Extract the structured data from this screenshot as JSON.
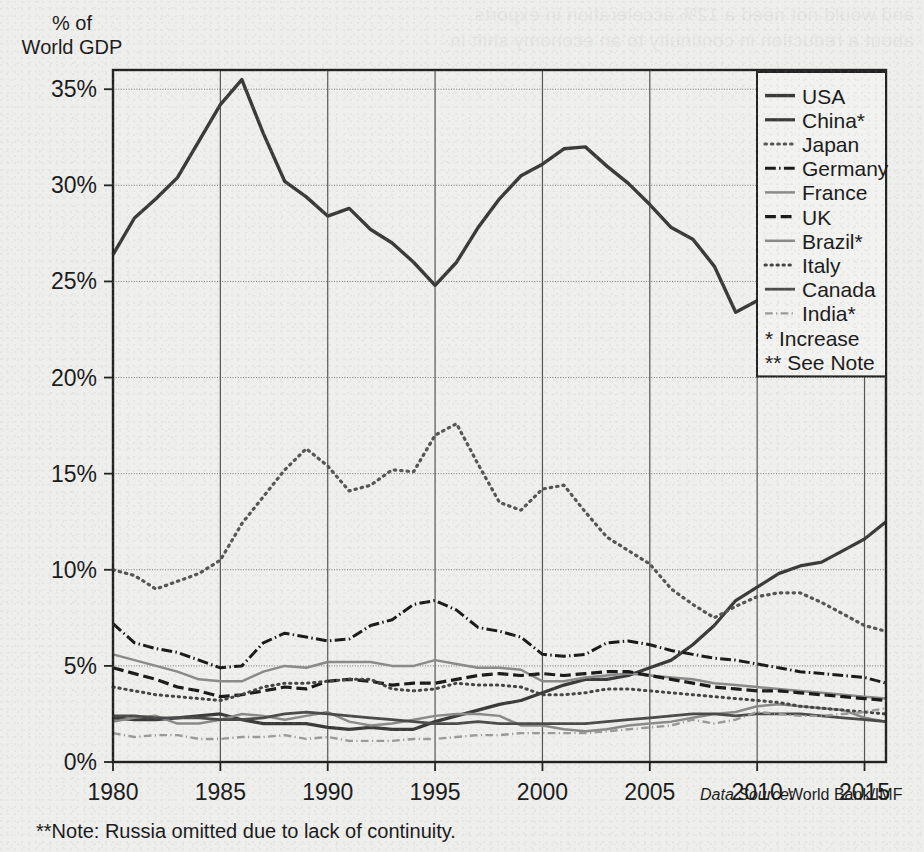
{
  "figure": {
    "y_axis_title_line1": "% of",
    "y_axis_title_line2": "World GDP",
    "note": "**Note: Russia omitted due to lack of continuity.",
    "source_prefix": "Data Source:",
    "source_value": "World Bank/IMF",
    "bleed_line1": "and would not need a 12% acceleration in exports.",
    "bleed_line2": "about a reduction in continuity to an economy shift in"
  },
  "legend": {
    "entries": [
      {
        "label": "USA",
        "style": "solid-thick",
        "color": "#3a3a3a"
      },
      {
        "label": "China*",
        "style": "solid-thick",
        "color": "#3a3a3a"
      },
      {
        "label": "Japan",
        "style": "dotted",
        "color": "#555555"
      },
      {
        "label": "Germany",
        "style": "dash-dot",
        "color": "#1a1a1a"
      },
      {
        "label": "France",
        "style": "solid-thin",
        "color": "#8a8a8a"
      },
      {
        "label": "UK",
        "style": "long-dash",
        "color": "#1a1a1a"
      },
      {
        "label": "Brazil*",
        "style": "solid-thin",
        "color": "#8a8a8a"
      },
      {
        "label": "Italy",
        "style": "dotted",
        "color": "#444444"
      },
      {
        "label": "Canada",
        "style": "solid-thick",
        "color": "#4a4a4a"
      },
      {
        "label": "India*",
        "style": "dash-dot-thin",
        "color": "#9a9a9a"
      }
    ],
    "footnotes": [
      "* Increase",
      "** See Note"
    ]
  },
  "chart_data": {
    "type": "line",
    "title": "",
    "xlabel": "",
    "ylabel": "% of World GDP",
    "xlim": [
      1980,
      2016
    ],
    "ylim": [
      0,
      36
    ],
    "grid": true,
    "legend_position": "top-right",
    "xticks": [
      1980,
      1985,
      1990,
      1995,
      2000,
      2005,
      2010,
      2015
    ],
    "yticks": [
      0,
      5,
      10,
      15,
      20,
      25,
      30,
      35
    ],
    "ytick_labels": [
      "0%",
      "5%",
      "10%",
      "15%",
      "20%",
      "25%",
      "30%",
      "35%"
    ],
    "x": [
      1980,
      1981,
      1982,
      1983,
      1984,
      1985,
      1986,
      1987,
      1988,
      1989,
      1990,
      1991,
      1992,
      1993,
      1994,
      1995,
      1996,
      1997,
      1998,
      1999,
      2000,
      2001,
      2002,
      2003,
      2004,
      2005,
      2006,
      2007,
      2008,
      2009,
      2010,
      2011,
      2012,
      2013,
      2014,
      2015,
      2016
    ],
    "series": [
      {
        "name": "USA",
        "style": "solid-thick",
        "color": "#3a3a3a",
        "width": 3.4,
        "values": [
          26.4,
          28.3,
          29.3,
          30.4,
          32.3,
          34.2,
          35.5,
          32.7,
          30.2,
          29.4,
          28.4,
          28.8,
          27.7,
          27.0,
          26.0,
          24.8,
          26.0,
          27.8,
          29.3,
          30.5,
          31.1,
          31.9,
          32.0,
          31.0,
          30.1,
          29.0,
          27.8,
          27.2,
          25.8,
          23.4,
          24.0,
          22.1,
          21.8,
          21.6,
          21.2,
          20.5,
          20.1
        ]
      },
      {
        "name": "China*",
        "style": "solid-thick",
        "color": "#3a3a3a",
        "width": 3.2,
        "values": [
          2.3,
          2.2,
          2.2,
          2.3,
          2.4,
          2.5,
          2.2,
          2.0,
          2.0,
          2.0,
          1.8,
          1.7,
          1.8,
          1.7,
          1.7,
          2.1,
          2.4,
          2.7,
          3.0,
          3.2,
          3.6,
          4.0,
          4.3,
          4.3,
          4.5,
          4.9,
          5.3,
          6.1,
          7.1,
          8.4,
          9.1,
          9.8,
          10.2,
          10.4,
          11.0,
          11.6,
          12.5
        ]
      },
      {
        "name": "Japan",
        "style": "dotted",
        "color": "#555555",
        "width": 3.2,
        "values": [
          10.0,
          9.7,
          9.0,
          9.4,
          9.8,
          10.5,
          12.4,
          13.8,
          15.2,
          16.3,
          15.4,
          14.1,
          14.4,
          15.2,
          15.1,
          17.0,
          17.6,
          15.5,
          13.5,
          13.1,
          14.2,
          14.4,
          13.0,
          11.7,
          11.0,
          10.3,
          9.0,
          8.2,
          7.5,
          8.1,
          8.6,
          8.8,
          8.8,
          8.3,
          7.7,
          7.1,
          6.8
        ]
      },
      {
        "name": "Germany",
        "style": "dash-dot",
        "color": "#1a1a1a",
        "width": 3.0,
        "values": [
          7.2,
          6.2,
          5.9,
          5.7,
          5.3,
          4.9,
          5.0,
          6.2,
          6.7,
          6.5,
          6.3,
          6.4,
          7.1,
          7.4,
          8.2,
          8.4,
          7.9,
          7.0,
          6.8,
          6.5,
          5.6,
          5.5,
          5.6,
          6.2,
          6.3,
          6.1,
          5.8,
          5.6,
          5.4,
          5.3,
          5.1,
          4.9,
          4.7,
          4.6,
          4.5,
          4.4,
          4.1
        ]
      },
      {
        "name": "France",
        "style": "solid-thin",
        "color": "#8a8a8a",
        "width": 2.5,
        "values": [
          5.6,
          5.3,
          5.0,
          4.7,
          4.3,
          4.2,
          4.2,
          4.7,
          5.0,
          4.9,
          5.2,
          5.2,
          5.2,
          5.0,
          5.0,
          5.3,
          5.1,
          4.9,
          4.9,
          4.8,
          4.2,
          4.2,
          4.4,
          4.5,
          4.6,
          4.5,
          4.4,
          4.3,
          4.1,
          4.0,
          3.9,
          3.8,
          3.7,
          3.6,
          3.5,
          3.4,
          3.3
        ]
      },
      {
        "name": "UK",
        "style": "long-dash",
        "color": "#1a1a1a",
        "width": 3.2,
        "values": [
          4.9,
          4.6,
          4.3,
          3.9,
          3.7,
          3.4,
          3.5,
          3.7,
          3.9,
          3.8,
          4.2,
          4.3,
          4.2,
          4.0,
          4.1,
          4.1,
          4.3,
          4.5,
          4.6,
          4.5,
          4.6,
          4.5,
          4.6,
          4.7,
          4.7,
          4.5,
          4.3,
          4.1,
          3.9,
          3.8,
          3.7,
          3.7,
          3.6,
          3.5,
          3.4,
          3.3,
          3.2
        ]
      },
      {
        "name": "Brazil*",
        "style": "solid-thin",
        "color": "#8a8a8a",
        "width": 2.5,
        "values": [
          2.1,
          2.3,
          2.4,
          2.0,
          2.0,
          2.2,
          2.5,
          2.4,
          2.2,
          2.4,
          2.6,
          2.1,
          1.9,
          2.0,
          2.2,
          2.4,
          2.5,
          2.5,
          2.4,
          1.9,
          1.9,
          1.7,
          1.6,
          1.7,
          1.9,
          2.0,
          2.1,
          2.3,
          2.5,
          2.6,
          2.9,
          3.0,
          2.9,
          2.8,
          2.7,
          2.3,
          2.1
        ]
      },
      {
        "name": "Italy",
        "style": "dotted",
        "color": "#444444",
        "width": 3.0,
        "values": [
          3.9,
          3.7,
          3.5,
          3.4,
          3.3,
          3.2,
          3.5,
          3.9,
          4.1,
          4.1,
          4.2,
          4.3,
          4.3,
          3.8,
          3.7,
          3.8,
          4.1,
          4.0,
          4.0,
          3.9,
          3.5,
          3.5,
          3.6,
          3.8,
          3.8,
          3.7,
          3.6,
          3.5,
          3.4,
          3.3,
          3.2,
          3.1,
          2.9,
          2.8,
          2.7,
          2.6,
          2.5
        ]
      },
      {
        "name": "Canada",
        "style": "solid-thick",
        "color": "#4a4a4a",
        "width": 2.8,
        "values": [
          2.4,
          2.4,
          2.3,
          2.3,
          2.3,
          2.2,
          2.2,
          2.3,
          2.5,
          2.6,
          2.5,
          2.4,
          2.3,
          2.2,
          2.1,
          2.0,
          2.0,
          2.1,
          2.0,
          2.0,
          2.0,
          2.0,
          2.0,
          2.1,
          2.2,
          2.3,
          2.4,
          2.5,
          2.5,
          2.4,
          2.5,
          2.5,
          2.5,
          2.4,
          2.3,
          2.2,
          2.1
        ]
      },
      {
        "name": "India*",
        "style": "dash-dot-thin",
        "color": "#9a9a9a",
        "width": 2.4,
        "values": [
          1.5,
          1.3,
          1.4,
          1.4,
          1.2,
          1.2,
          1.3,
          1.3,
          1.4,
          1.2,
          1.3,
          1.1,
          1.1,
          1.1,
          1.2,
          1.2,
          1.3,
          1.4,
          1.4,
          1.5,
          1.5,
          1.5,
          1.5,
          1.6,
          1.7,
          1.8,
          1.9,
          2.2,
          2.0,
          2.2,
          2.6,
          2.5,
          2.4,
          2.4,
          2.5,
          2.6,
          2.8
        ]
      }
    ]
  }
}
